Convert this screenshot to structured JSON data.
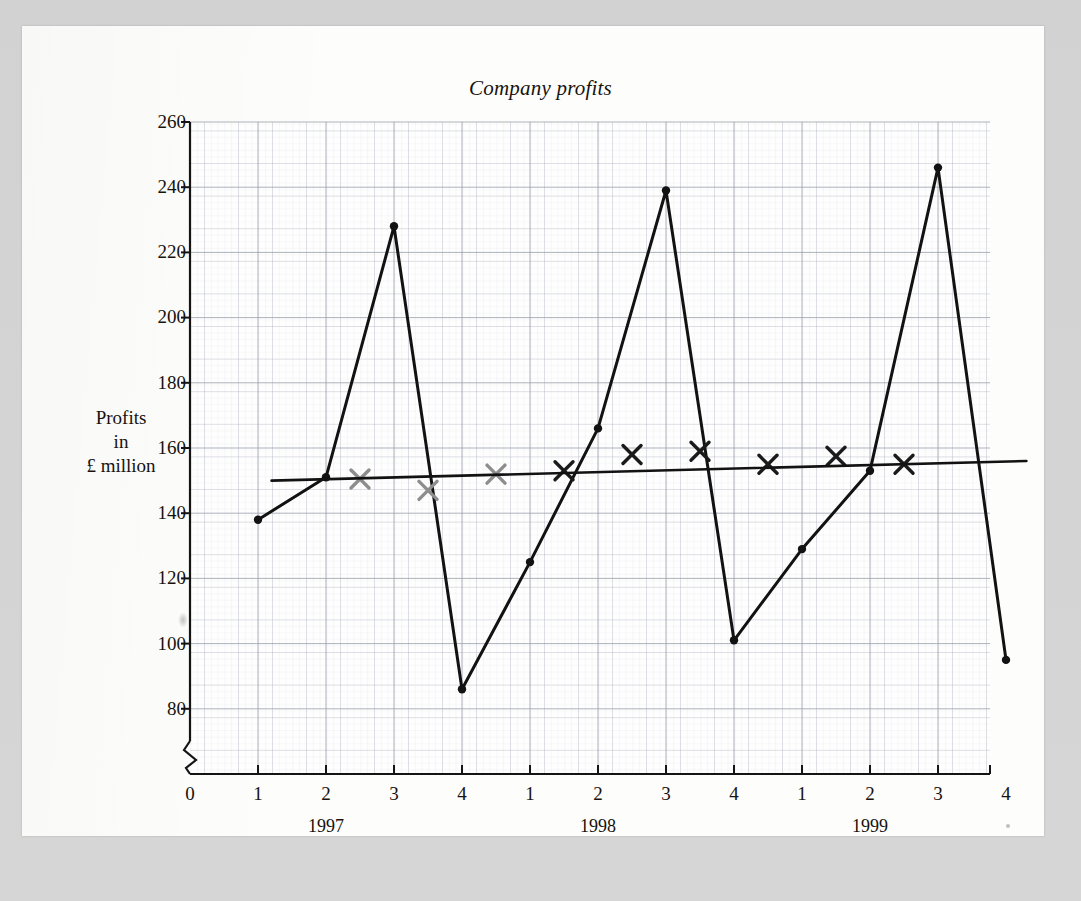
{
  "figure": {
    "title": "Company profits",
    "y_axis_label_lines": [
      "Profits",
      "in",
      "£ million"
    ],
    "axis_break_present": true
  },
  "chart_data": {
    "type": "line",
    "title": "Company profits",
    "xlabel": "",
    "ylabel": "Profits in £ million",
    "ylim": [
      80,
      260
    ],
    "ytick_step": 20,
    "yticks": [
      80,
      100,
      120,
      140,
      160,
      180,
      200,
      220,
      240,
      260
    ],
    "grid": true,
    "x_tick_labels": [
      "0",
      "1",
      "2",
      "3",
      "4",
      "1",
      "2",
      "3",
      "4",
      "1",
      "2",
      "3",
      "4"
    ],
    "year_group_labels": [
      "1997",
      "1998",
      "1999"
    ],
    "categories": [
      "1997 Q1",
      "1997 Q2",
      "1997 Q3",
      "1997 Q4",
      "1998 Q1",
      "1998 Q2",
      "1998 Q3",
      "1998 Q4",
      "1999 Q1",
      "1999 Q2",
      "1999 Q3",
      "1999 Q4"
    ],
    "series": [
      {
        "name": "Quarterly profits",
        "marker": "dot",
        "color": "#121212",
        "x": [
          1,
          2,
          3,
          4,
          5,
          6,
          7,
          8,
          9,
          10,
          11,
          12
        ],
        "values": [
          138,
          151,
          228,
          86,
          125,
          166,
          239,
          101,
          129,
          153,
          246,
          95
        ]
      },
      {
        "name": "Four-quarter moving average",
        "marker": "cross",
        "color": "#7a7a7a",
        "x": [
          2.5,
          3.5,
          4.5,
          5.5,
          6.5,
          7.5,
          8.5,
          9.5,
          10.5
        ],
        "values": [
          150.5,
          147,
          152,
          153,
          158,
          159,
          155,
          157.5,
          155
        ]
      },
      {
        "name": "Trend line",
        "marker": "none",
        "color": "#121212",
        "x": [
          1.2,
          12.3
        ],
        "values": [
          150,
          156
        ]
      }
    ],
    "annotations": []
  }
}
